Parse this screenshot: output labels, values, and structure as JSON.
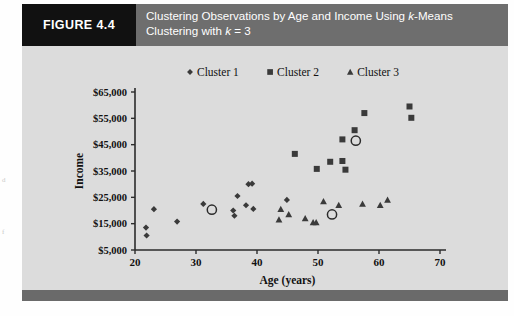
{
  "figure": {
    "label": "FIGURE 4.4",
    "title_line1": "Clustering Observations by Age and Income Using k-Means",
    "title_line2": "Clustering with k = 3",
    "label_bg": "#111111",
    "header_bg": "#6e6e6e",
    "plate_bg": "#dcdcdc",
    "footer_bg": "#6a6a6a"
  },
  "margin_notes": {
    "note1": "d",
    "note2": "f"
  },
  "chart_data": {
    "type": "scatter",
    "title": "Clustering Observations by Age and Income Using k-Means Clustering with k = 3",
    "xlabel": "Age (years)",
    "ylabel": "Income",
    "xlim": [
      20,
      70
    ],
    "ylim": [
      5000,
      65000
    ],
    "xticks": [
      20,
      30,
      40,
      50,
      60,
      70
    ],
    "xtick_labels": [
      "20",
      "30",
      "40",
      "50",
      "60",
      "70"
    ],
    "yticks": [
      5000,
      15000,
      25000,
      35000,
      45000,
      55000,
      65000
    ],
    "ytick_labels": [
      "$5,000",
      "$15,000",
      "$25,000",
      "$35,000",
      "$45,000",
      "$55,000",
      "$65,000"
    ],
    "grid": false,
    "legend_position": "top-center",
    "marker_color": "#3a3a3a",
    "series": [
      {
        "name": "Cluster 1",
        "marker": "diamond",
        "points": [
          [
            21.8,
            13500
          ],
          [
            21.9,
            10500
          ],
          [
            23.1,
            20500
          ],
          [
            26.9,
            15800
          ],
          [
            31.2,
            22500
          ],
          [
            36.1,
            20000
          ],
          [
            36.3,
            18000
          ],
          [
            36.8,
            25500
          ],
          [
            38.2,
            22000
          ],
          [
            38.6,
            30000
          ],
          [
            39.2,
            30200
          ],
          [
            39.4,
            20600
          ],
          [
            44.9,
            24000
          ]
        ]
      },
      {
        "name": "Cluster 2",
        "marker": "square",
        "points": [
          [
            46.2,
            41500
          ],
          [
            54.0,
            47000
          ],
          [
            56.0,
            50500
          ],
          [
            57.6,
            57000
          ],
          [
            52.0,
            38500
          ],
          [
            54.0,
            38800
          ],
          [
            54.5,
            35500
          ],
          [
            49.8,
            35800
          ],
          [
            65.0,
            59500
          ],
          [
            65.3,
            55200
          ]
        ]
      },
      {
        "name": "Cluster 3",
        "marker": "triangle",
        "points": [
          [
            43.9,
            20500
          ],
          [
            43.6,
            16500
          ],
          [
            45.2,
            18500
          ],
          [
            47.9,
            17000
          ],
          [
            49.2,
            15500
          ],
          [
            49.7,
            15500
          ],
          [
            50.9,
            23500
          ],
          [
            53.4,
            22000
          ],
          [
            57.3,
            22500
          ],
          [
            60.2,
            22000
          ],
          [
            61.4,
            24000
          ]
        ]
      }
    ],
    "centroids": {
      "name": "cluster centroids",
      "marker": "open-circle",
      "points": [
        [
          32.6,
          20300
        ],
        [
          52.3,
          18500
        ],
        [
          56.2,
          46500
        ]
      ]
    }
  }
}
